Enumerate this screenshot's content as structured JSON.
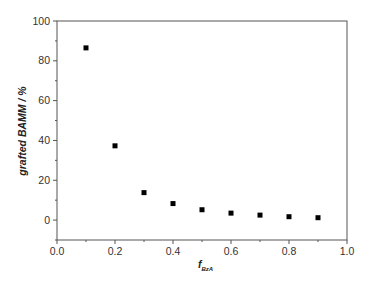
{
  "chart_data": {
    "type": "scatter",
    "title": "",
    "xlabel": "f",
    "xlabel_subscript": "BzA",
    "ylabel": "grafted BAMM / %",
    "xlim": [
      0.0,
      1.0
    ],
    "ylim": [
      -10,
      100
    ],
    "grid": false,
    "legend": null,
    "x_ticks": [
      0.0,
      0.2,
      0.4,
      0.6,
      0.8,
      1.0
    ],
    "x_tick_labels": [
      "0.0",
      "0.2",
      "0.4",
      "0.6",
      "0.8",
      "1.0"
    ],
    "y_ticks": [
      0,
      20,
      40,
      60,
      80,
      100
    ],
    "y_tick_labels": [
      "0",
      "20",
      "40",
      "60",
      "80",
      "100"
    ],
    "marker": "square",
    "marker_color": "#000000",
    "series": [
      {
        "name": "grafted BAMM",
        "x": [
          0.1,
          0.2,
          0.3,
          0.4,
          0.5,
          0.6,
          0.7,
          0.8,
          0.9
        ],
        "values": [
          86.5,
          37.3,
          13.8,
          8.3,
          5.2,
          3.5,
          2.5,
          1.7,
          1.2
        ]
      }
    ]
  }
}
